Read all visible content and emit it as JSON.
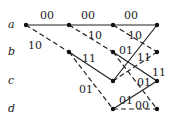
{
  "diagram": {
    "type": "trellis",
    "states": [
      "a",
      "b",
      "c",
      "d"
    ],
    "nodes": {
      "a0": [
        26,
        25
      ],
      "a1": [
        69,
        25
      ],
      "a2": [
        113,
        25
      ],
      "a3": [
        157,
        25
      ],
      "b1": [
        69,
        52
      ],
      "b2": [
        113,
        52
      ],
      "b3": [
        157,
        52
      ],
      "c2": [
        113,
        81
      ],
      "c3": [
        157,
        81
      ],
      "d2": [
        113,
        109
      ],
      "d3": [
        157,
        109
      ]
    },
    "edges": [
      {
        "from": "a0",
        "to": "a1",
        "style": "solid",
        "label": "00",
        "lx": 40,
        "ly": 10
      },
      {
        "from": "a0",
        "to": "b1",
        "style": "dashed",
        "label": "10",
        "lx": 28,
        "ly": 40
      },
      {
        "from": "a1",
        "to": "a2",
        "style": "solid",
        "label": "00",
        "lx": 81,
        "ly": 10
      },
      {
        "from": "a1",
        "to": "b2",
        "style": "dashed",
        "label": "10",
        "lx": 88,
        "ly": 30
      },
      {
        "from": "b1",
        "to": "c2",
        "style": "solid",
        "label": "11",
        "lx": 82,
        "ly": 53
      },
      {
        "from": "b1",
        "to": "d2",
        "style": "dashed",
        "label": "01",
        "lx": 79,
        "ly": 84
      },
      {
        "from": "a2",
        "to": "a3",
        "style": "solid",
        "label": "00",
        "lx": 124,
        "ly": 10
      },
      {
        "from": "a2",
        "to": "b3",
        "style": "dashed",
        "label": "10",
        "lx": 128,
        "ly": 30
      },
      {
        "from": "c2",
        "to": "a3",
        "style": "solid",
        "label": "",
        "lx": 0,
        "ly": 0
      },
      {
        "from": "c2",
        "to": "b3",
        "style": "dashed",
        "label": "11",
        "lx": 137,
        "ly": 52
      },
      {
        "from": "b2",
        "to": "c3",
        "style": "solid",
        "label": "01",
        "lx": 119,
        "ly": 45
      },
      {
        "from": "b2",
        "to": "d3",
        "style": "dashed",
        "label": "01",
        "lx": 137,
        "ly": 77
      },
      {
        "from": "d2",
        "to": "c3",
        "style": "solid",
        "label": "01",
        "lx": 119,
        "ly": 95
      },
      {
        "from": "d2",
        "to": "d3",
        "style": "dashed",
        "label": "00",
        "lx": 135,
        "ly": 100
      }
    ],
    "extra_labels": [
      {
        "text": "11",
        "x": 152,
        "y": 67
      }
    ]
  }
}
